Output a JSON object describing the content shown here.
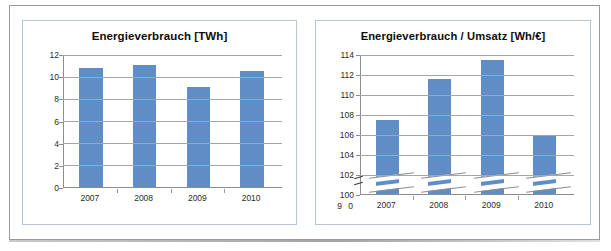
{
  "figure": {
    "panels": [
      "energy",
      "ratio"
    ]
  },
  "chart_data": [
    {
      "id": "energy",
      "type": "bar",
      "title": "Energieverbrauch [TWh]",
      "xlabel": "",
      "ylabel": "",
      "categories": [
        "2007",
        "2008",
        "2009",
        "2010"
      ],
      "values": [
        10.7,
        11.0,
        9.0,
        10.45
      ],
      "ylim": [
        0,
        12
      ],
      "yticks": [
        0,
        2,
        4,
        6,
        8,
        10,
        12
      ],
      "ytick_labels": [
        "0",
        "2",
        "4",
        "6",
        "8",
        "10",
        "12"
      ],
      "grid": true,
      "legend": "none",
      "bar_color": "#5f8dc6",
      "axis_break": false
    },
    {
      "id": "ratio",
      "type": "bar",
      "title": "Energieverbrauch / Umsatz [Wh/€]",
      "xlabel": "",
      "ylabel": "",
      "categories": [
        "2007",
        "2008",
        "2009",
        "2010"
      ],
      "values": [
        107.4,
        111.5,
        113.4,
        105.8
      ],
      "ylim": [
        100,
        114
      ],
      "yticks": [
        100,
        102,
        104,
        106,
        108,
        110,
        112,
        114
      ],
      "ytick_labels": [
        "100",
        "102",
        "104",
        "106",
        "108",
        "110",
        "112",
        "114"
      ],
      "axis_break": true,
      "axis_break_labels": [
        "9",
        "0"
      ],
      "grid": true,
      "legend": "none",
      "bar_color": "#5f8dc6"
    }
  ]
}
